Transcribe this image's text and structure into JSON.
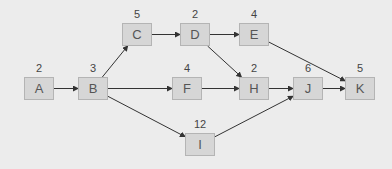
{
  "diagram": {
    "type": "activity-network",
    "nodes": [
      {
        "id": "A",
        "label": "A",
        "duration": "2",
        "x": 24,
        "y": 77
      },
      {
        "id": "B",
        "label": "B",
        "duration": "3",
        "x": 78,
        "y": 77
      },
      {
        "id": "C",
        "label": "C",
        "duration": "5",
        "x": 122,
        "y": 23
      },
      {
        "id": "D",
        "label": "D",
        "duration": "2",
        "x": 180,
        "y": 23
      },
      {
        "id": "E",
        "label": "E",
        "duration": "4",
        "x": 239,
        "y": 23
      },
      {
        "id": "F",
        "label": "F",
        "duration": "4",
        "x": 172,
        "y": 77
      },
      {
        "id": "H",
        "label": "H",
        "duration": "2",
        "x": 239,
        "y": 77
      },
      {
        "id": "J",
        "label": "J",
        "duration": "6",
        "x": 293,
        "y": 77
      },
      {
        "id": "K",
        "label": "K",
        "duration": "5",
        "x": 345,
        "y": 77
      },
      {
        "id": "I",
        "label": "I",
        "duration": "12",
        "x": 185,
        "y": 133
      }
    ],
    "edges": [
      {
        "from": "A",
        "to": "B"
      },
      {
        "from": "B",
        "to": "C"
      },
      {
        "from": "B",
        "to": "F"
      },
      {
        "from": "B",
        "to": "I"
      },
      {
        "from": "C",
        "to": "D"
      },
      {
        "from": "D",
        "to": "E"
      },
      {
        "from": "D",
        "to": "H"
      },
      {
        "from": "E",
        "to": "K"
      },
      {
        "from": "F",
        "to": "H"
      },
      {
        "from": "H",
        "to": "J"
      },
      {
        "from": "I",
        "to": "J"
      },
      {
        "from": "J",
        "to": "K"
      }
    ],
    "colors": {
      "background": "#ececec",
      "node_fill": "#d6d6d6",
      "node_border": "#b4b4b4",
      "edge": "#333333",
      "text": "#555555"
    }
  }
}
